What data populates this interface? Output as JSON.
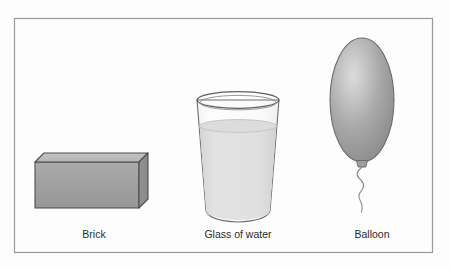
{
  "figure": {
    "background_color": "#fdfdfd",
    "border_color": "#9a9a9a",
    "border": {
      "x": 14,
      "y": 18,
      "width": 419,
      "height": 235
    }
  },
  "objects": [
    {
      "id": "brick",
      "label": "Brick",
      "label_x": 94,
      "label_y": 238,
      "outline_color": "#4a4a4a",
      "front_face_color": "#a0a0a0",
      "top_face_color": "#bcbcbc",
      "side_face_color": "#8e8e8e",
      "geometry": {
        "front": "35,162 35,208 139,208 139,162",
        "top": "35,162 44,153 148,153 139,162",
        "side": "139,162 148,153 148,199 139,208"
      }
    },
    {
      "id": "glass-of-water",
      "label": "Glass of water",
      "label_x": 238,
      "label_y": 238,
      "outline_color": "#6e6e6e",
      "glass_color": "#fbfbfb",
      "water_color": "#dedede",
      "water_surface_color": "#d2d2d2",
      "geometry": {
        "rim_cx": 238,
        "rim_cy": 100,
        "rim_rx": 41,
        "rim_ry": 8,
        "bottom_cy": 214,
        "bottom_rx": 32,
        "water_level_cy": 126,
        "water_level_rx": 39.2
      }
    },
    {
      "id": "balloon",
      "label": "Balloon",
      "label_x": 372,
      "label_y": 238,
      "outline_color": "#6b6b6b",
      "body_color": "#9d9d9d",
      "highlight_color": "#d8d8d8",
      "shadow_color": "#868686",
      "knot_color": "#9a9a9a",
      "string_color": "#8a8a8a",
      "geometry": {
        "cx": 362,
        "cy": 100,
        "rx": 32,
        "ry": 62,
        "knot_x": 362,
        "knot_y": 163,
        "string_end_y": 212
      }
    }
  ]
}
